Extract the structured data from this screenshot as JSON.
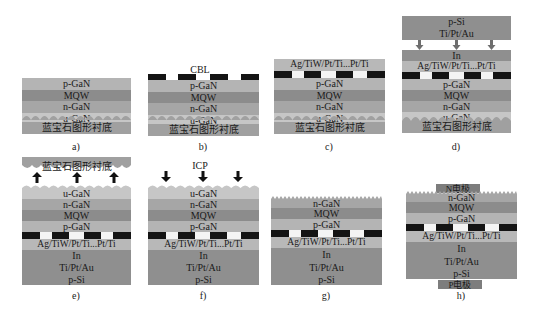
{
  "figure": {
    "colors": {
      "p_gan": "#b4b4b4",
      "mqw": "#8c8c8c",
      "n_gan": "#a6a6a6",
      "u_gan": "#c6c6c6",
      "sapphire": "#a0a0a0",
      "metal_stack": "#b8b8b8",
      "bonding_layers": "#8f8f8f",
      "cbl": "#141414"
    },
    "layer_labels": {
      "p_gan": "p-GaN",
      "mqw": "MQW",
      "n_gan": "n-GaN",
      "u_gan": "u-GaN",
      "sapphire": "蓝宝石图形衬底",
      "metal": "Ag/TiW/Pt/Ti...Pt/Ti",
      "in": "In",
      "tiptau": "Ti/Pt/Au",
      "psi": "p-Si",
      "n_electrode": "N电极",
      "p_electrode": "P电极"
    },
    "annotations": {
      "cbl": "CBL",
      "icp": "ICP"
    },
    "panels": [
      {
        "id": "a",
        "caption": "a)",
        "layers_top_to_bottom": [
          "p-GaN",
          "MQW",
          "n-GaN",
          "u-GaN",
          "蓝宝石图形衬底"
        ]
      },
      {
        "id": "b",
        "caption": "b)",
        "layers_top_to_bottom": [
          "CBL",
          "p-GaN",
          "MQW",
          "n-GaN",
          "u-GaN",
          "蓝宝石图形衬底"
        ]
      },
      {
        "id": "c",
        "caption": "c)",
        "layers_top_to_bottom": [
          "Ag/TiW/Pt/Ti...Pt/Ti",
          "CBL",
          "p-GaN",
          "MQW",
          "n-GaN",
          "u-GaN",
          "蓝宝石图形衬底"
        ]
      },
      {
        "id": "d",
        "caption": "d)",
        "top_block": [
          "p-Si",
          "Ti/Pt/Au"
        ],
        "layers_top_to_bottom": [
          "In",
          "Ag/TiW/Pt/Ti...Pt/Ti",
          "CBL",
          "p-GaN",
          "MQW",
          "n-GaN",
          "u-GaN",
          "蓝宝石图形衬底"
        ]
      },
      {
        "id": "e",
        "caption": "e)",
        "lifted": "蓝宝石图形衬底",
        "layers_top_to_bottom": [
          "u-GaN",
          "n-GaN",
          "MQW",
          "p-GaN",
          "CBL",
          "Ag/TiW/Pt/Ti...Pt/Ti",
          "In",
          "Ti/Pt/Au",
          "p-Si"
        ]
      },
      {
        "id": "f",
        "caption": "f)",
        "etch": "ICP",
        "layers_top_to_bottom": [
          "u-GaN",
          "n-GaN",
          "MQW",
          "p-GaN",
          "CBL",
          "Ag/TiW/Pt/Ti...Pt/Ti",
          "In",
          "Ti/Pt/Au",
          "p-Si"
        ]
      },
      {
        "id": "g",
        "caption": "g)",
        "layers_top_to_bottom": [
          "n-GaN",
          "MQW",
          "p-GaN",
          "CBL",
          "Ag/TiW/Pt/Ti...Pt/Ti",
          "In",
          "Ti/Pt/Au",
          "p-Si"
        ]
      },
      {
        "id": "h",
        "caption": "h)",
        "layers_top_to_bottom": [
          "N电极",
          "n-GaN",
          "MQW",
          "p-GaN",
          "CBL",
          "Ag/TiW/Pt/Ti...Pt/Ti",
          "In",
          "Ti/Pt/Au",
          "p-Si",
          "P电极"
        ]
      }
    ]
  }
}
